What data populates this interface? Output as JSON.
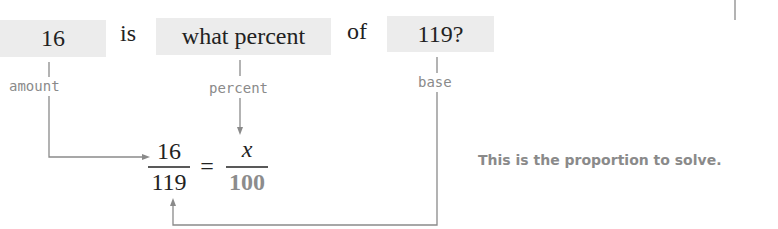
{
  "sentence": {
    "amount_box": "16",
    "word_is": "is",
    "percent_box": "what percent",
    "word_of": "of",
    "base_box": "119?"
  },
  "labels": {
    "amount": "amount",
    "percent": "percent",
    "base": "base"
  },
  "proportion": {
    "left_numerator": "16",
    "left_denominator": "119",
    "equals": "=",
    "right_numerator": "x",
    "right_denominator": "100"
  },
  "note": "This is the proportion to solve."
}
